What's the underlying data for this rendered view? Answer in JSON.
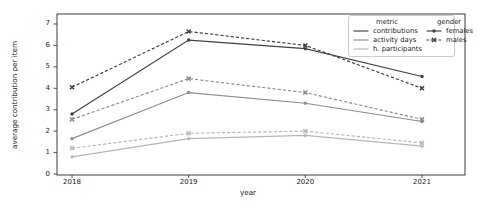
{
  "axes": {
    "ylabel": "average contribution per item",
    "xlabel": "year",
    "x_ticks": [
      "2018",
      "2019",
      "2020",
      "2021"
    ],
    "y_ticks": [
      "0",
      "1",
      "2",
      "3",
      "4",
      "5",
      "6",
      "7"
    ]
  },
  "legend": {
    "columns": [
      {
        "title": "metric",
        "items": [
          {
            "label": "contributions",
            "color": "#404040",
            "line": "solid",
            "marker": "none"
          },
          {
            "label": "activity days",
            "color": "#8c8c8c",
            "line": "solid",
            "marker": "none"
          },
          {
            "label": "h. participants",
            "color": "#b6b6b6",
            "line": "solid",
            "marker": "none"
          }
        ]
      },
      {
        "title": "gender",
        "items": [
          {
            "label": "females",
            "color": "#404040",
            "line": "solid",
            "marker": "circle"
          },
          {
            "label": "males",
            "color": "#404040",
            "line": "dashed",
            "marker": "x"
          }
        ]
      }
    ]
  },
  "chart_data": {
    "type": "line",
    "x": [
      2018,
      2019,
      2020,
      2021
    ],
    "xlabel": "year",
    "ylabel": "average contribution per item",
    "ylim": [
      0,
      7
    ],
    "grid": false,
    "legend_position": "upper right",
    "series": [
      {
        "metric": "contributions",
        "gender": "females",
        "color": "#404040",
        "line": "solid",
        "marker": "circle",
        "values": [
          2.8,
          6.25,
          5.85,
          4.55
        ]
      },
      {
        "metric": "contributions",
        "gender": "males",
        "color": "#404040",
        "line": "dashed",
        "marker": "x",
        "values": [
          4.05,
          6.65,
          6.0,
          4.0
        ]
      },
      {
        "metric": "activity days",
        "gender": "females",
        "color": "#8c8c8c",
        "line": "solid",
        "marker": "circle",
        "values": [
          1.65,
          3.8,
          3.3,
          2.45
        ]
      },
      {
        "metric": "activity days",
        "gender": "males",
        "color": "#8c8c8c",
        "line": "dashed",
        "marker": "x",
        "values": [
          2.55,
          4.45,
          3.8,
          2.55
        ]
      },
      {
        "metric": "h. participants",
        "gender": "females",
        "color": "#b6b6b6",
        "line": "solid",
        "marker": "circle",
        "values": [
          0.8,
          1.65,
          1.8,
          1.3
        ]
      },
      {
        "metric": "h. participants",
        "gender": "males",
        "color": "#b6b6b6",
        "line": "dashed",
        "marker": "x",
        "values": [
          1.2,
          1.9,
          2.0,
          1.45
        ]
      }
    ]
  }
}
